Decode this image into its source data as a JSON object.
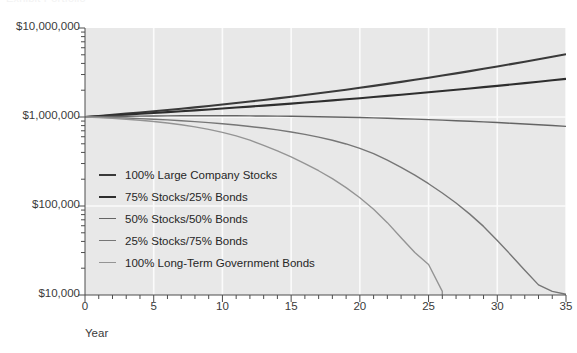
{
  "caption": {
    "clipped_top_text": "Exhibit  Portfolio"
  },
  "chart_data": {
    "type": "line",
    "title": "",
    "xlabel": "Year",
    "ylabel": "",
    "xlim": [
      0,
      35
    ],
    "ylim": [
      10000,
      10000000
    ],
    "yscale": "log",
    "grid": true,
    "legend_position": "inside-left",
    "x_ticks": [
      0,
      5,
      10,
      15,
      20,
      25,
      30,
      35
    ],
    "x_tick_labels": [
      "0",
      "5",
      "10",
      "15",
      "20",
      "25",
      "30",
      "35"
    ],
    "y_ticks": [
      10000,
      100000,
      1000000,
      10000000
    ],
    "y_tick_labels": [
      "$10,000",
      "$100,000",
      "$1,000,000",
      "$10,000,000"
    ],
    "x": [
      0,
      1,
      2,
      3,
      4,
      5,
      6,
      7,
      8,
      9,
      10,
      11,
      12,
      13,
      14,
      15,
      16,
      17,
      18,
      19,
      20,
      21,
      22,
      23,
      24,
      25,
      26,
      27,
      28,
      29,
      30,
      31,
      32,
      33,
      34,
      35
    ],
    "series": [
      {
        "name": "100% Large Company Stocks",
        "color": "#3a3a3a",
        "width": 2.1,
        "values": [
          1000000,
          1028000,
          1058000,
          1090000,
          1124000,
          1160000,
          1199000,
          1240000,
          1284000,
          1331000,
          1381000,
          1435000,
          1492000,
          1554000,
          1620000,
          1690000,
          1766000,
          1847000,
          1934000,
          2028000,
          2129000,
          2238000,
          2355000,
          2481000,
          2617000,
          2764000,
          2922000,
          3093000,
          3278000,
          3478000,
          3694000,
          3928000,
          4181000,
          4455000,
          4752000,
          5074000
        ]
      },
      {
        "name": "75% Stocks/25% Bonds",
        "color": "#2e2e2e",
        "width": 2.1,
        "values": [
          1000000,
          1020000,
          1041000,
          1063000,
          1086000,
          1110000,
          1135000,
          1161000,
          1188000,
          1216000,
          1246000,
          1277000,
          1309000,
          1343000,
          1378000,
          1415000,
          1454000,
          1494000,
          1536000,
          1581000,
          1627000,
          1676000,
          1727000,
          1781000,
          1837000,
          1896000,
          1958000,
          2023000,
          2092000,
          2164000,
          2240000,
          2320000,
          2404000,
          2493000,
          2586000,
          2684000
        ]
      },
      {
        "name": "50% Stocks/50% Bonds",
        "color": "#646464",
        "width": 1.4,
        "values": [
          1000000,
          1007000,
          1013000,
          1018000,
          1022000,
          1026000,
          1029000,
          1031000,
          1032000,
          1032000,
          1032000,
          1031000,
          1029000,
          1026000,
          1023000,
          1019000,
          1014000,
          1008000,
          1001000,
          994000,
          986000,
          977000,
          967000,
          957000,
          946000,
          934000,
          922000,
          909000,
          895000,
          881000,
          866000,
          851000,
          835000,
          819000,
          802000,
          785000
        ]
      },
      {
        "name": "25% Stocks/75% Bonds",
        "color": "#767676",
        "width": 1.4,
        "values": [
          1000000,
          993000,
          984000,
          973000,
          960000,
          945000,
          928000,
          909000,
          888000,
          865000,
          840000,
          813000,
          783000,
          751000,
          716000,
          678000,
          638000,
          594000,
          548000,
          498000,
          445000,
          388000,
          328000,
          272000,
          222000,
          178000,
          140000,
          108000,
          81000,
          59000,
          41000,
          28000,
          19000,
          13000,
          11000,
          10200
        ]
      },
      {
        "name": "100% Long-Term Government Bonds",
        "color": "#949494",
        "width": 1.4,
        "values": [
          1000000,
          985000,
          967000,
          945000,
          919000,
          889000,
          855000,
          817000,
          774000,
          726000,
          673000,
          614000,
          550000,
          481000,
          416000,
          356000,
          300000,
          249000,
          203000,
          161000,
          124000,
          92000,
          65000,
          44000,
          30000,
          22000,
          11000,
          null,
          null,
          null,
          null,
          null,
          null,
          null,
          null,
          null
        ]
      }
    ],
    "notes": [
      "Both bond-heavy portfolios are depleted: 100% Long-Term Government Bonds collapses near year 25, 25% Stocks/75% Bonds collapses near year 35."
    ]
  },
  "legend": {
    "items": [
      {
        "label": "100% Large Company Stocks",
        "color": "#3a3a3a",
        "width": "2.1px"
      },
      {
        "label": "75% Stocks/25% Bonds",
        "color": "#2e2e2e",
        "width": "2.1px"
      },
      {
        "label": "50% Stocks/50% Bonds",
        "color": "#646464",
        "width": "1.4px"
      },
      {
        "label": "25% Stocks/75% Bonds",
        "color": "#767676",
        "width": "1.4px"
      },
      {
        "label": "100% Long-Term Government Bonds",
        "color": "#949494",
        "width": "1.4px"
      }
    ]
  },
  "colors": {
    "plot_background": "#e8e8e8",
    "grid": "#fbfbfb",
    "axis": "#4d4d4d",
    "text": "#3a3a3a"
  }
}
